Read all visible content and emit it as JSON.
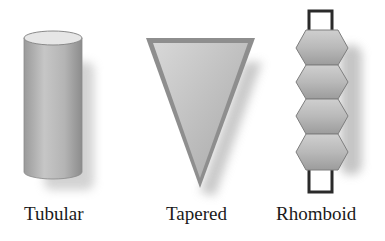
{
  "shapes": [
    {
      "name": "tubular",
      "label": "Tubular"
    },
    {
      "name": "tapered",
      "label": "Tapered"
    },
    {
      "name": "rhomboid",
      "label": "Rhomboid"
    }
  ],
  "colors": {
    "fill_light": "#d4d4d4",
    "fill_dark": "#8f8f8f",
    "shadow": "#bdbdbd",
    "outline": "#2a2a2a"
  }
}
